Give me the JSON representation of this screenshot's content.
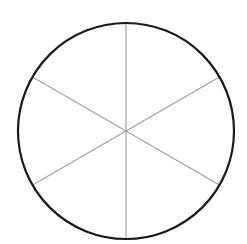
{
  "diagram": {
    "title": "",
    "shape": "circle divided into 6 equal sectors",
    "circle": {
      "cx": 126,
      "cy": 131,
      "r": 108,
      "stroke": "#1a1a1a",
      "stroke_width": 2.2
    },
    "divider_color": "#a0a0a0",
    "divider_width": 1.2,
    "sector_count": 6,
    "dividers": [
      {
        "name": "vertical",
        "x1": 126,
        "y1": 23,
        "x2": 126,
        "y2": 239
      },
      {
        "name": "diag-a",
        "x1": 32.5,
        "y1": 77,
        "x2": 219.5,
        "y2": 185
      },
      {
        "name": "diag-b",
        "x1": 219.5,
        "y1": 77,
        "x2": 32.5,
        "y2": 185
      }
    ]
  }
}
